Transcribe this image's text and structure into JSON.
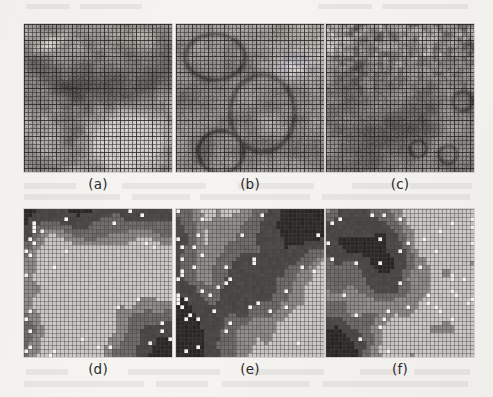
{
  "figure": {
    "type": "image-panel-grid",
    "rows": 2,
    "cols": 3,
    "background_color": "#f5f4f1",
    "panel_size_px": 148,
    "caption_note": "Six-panel scanned figure: top row histology tiles with grid overlay, bottom row corresponding blocky classification maps",
    "panels": [
      {
        "id": "a",
        "label": "(a)",
        "kind": "histology-tile",
        "row": 0,
        "col": 0,
        "x": 24,
        "y": 24,
        "grid_overlay": true,
        "grid_cells": 37,
        "grid_line_color": "#4a4844",
        "base_color": "#8f8d89",
        "description": "Glandular tissue band across upper-middle with large pale lumen region lower-right",
        "seed": 1101
      },
      {
        "id": "b",
        "label": "(b)",
        "kind": "histology-tile",
        "row": 0,
        "col": 1,
        "x": 176,
        "y": 24,
        "grid_overlay": true,
        "grid_cells": 37,
        "grid_line_color": "#4a4844",
        "base_color": "#94928e",
        "description": "Diffuse stromal texture with curved duct outlines, brighter upper-right cluster",
        "seed": 2202
      },
      {
        "id": "c",
        "label": "(c)",
        "kind": "histology-tile",
        "row": 0,
        "col": 2,
        "x": 326,
        "y": 24,
        "grid_overlay": true,
        "grid_cells": 37,
        "grid_line_color": "#4a4844",
        "base_color": "#8a8884",
        "description": "Dense vesicular cell field upper half, smoother dark region lower-left, ring structures right edge",
        "seed": 3303
      },
      {
        "id": "d",
        "label": "(d)",
        "kind": "classification-map",
        "row": 1,
        "col": 0,
        "x": 24,
        "y": 209,
        "grid_overlay": true,
        "grid_cells": 37,
        "grid_line_color": "#63615d",
        "description": "Segmentation of (a): light background, dark cluster across top, very dark block lower-right, scattered white cells on left margin",
        "seed": 4404,
        "class_levels": [
          "#c9c7c3",
          "#8f8d89",
          "#6e6c68",
          "#4b4946",
          "#2a2927",
          "#f2f1ee"
        ],
        "class_names": [
          "background",
          "stroma",
          "epithelium",
          "gland",
          "lumen",
          "highlight"
        ]
      },
      {
        "id": "e",
        "label": "(e)",
        "kind": "classification-map",
        "row": 1,
        "col": 1,
        "x": 176,
        "y": 209,
        "grid_overlay": true,
        "grid_cells": 37,
        "grid_line_color": "#63615d",
        "description": "Segmentation of (b): diagonal dark band from lower-left to upper-right, dense white speckle along left edge, light background elsewhere",
        "seed": 5505,
        "class_levels": [
          "#c9c7c3",
          "#8f8d89",
          "#6e6c68",
          "#4b4946",
          "#2a2927",
          "#f2f1ee"
        ],
        "class_names": [
          "background",
          "stroma",
          "epithelium",
          "gland",
          "lumen",
          "highlight"
        ]
      },
      {
        "id": "f",
        "label": "(f)",
        "kind": "classification-map",
        "row": 1,
        "col": 2,
        "x": 326,
        "y": 209,
        "grid_overlay": true,
        "grid_cells": 37,
        "grid_line_color": "#63615d",
        "description": "Segmentation of (c): dark mass across upper-left and lower-left corner, white speckled clusters on right side, light background",
        "seed": 6606,
        "class_levels": [
          "#c9c7c3",
          "#8f8d89",
          "#6e6c68",
          "#4b4946",
          "#2a2927",
          "#f2f1ee"
        ],
        "class_names": [
          "background",
          "stroma",
          "epithelium",
          "gland",
          "lumen",
          "highlight"
        ]
      }
    ]
  }
}
